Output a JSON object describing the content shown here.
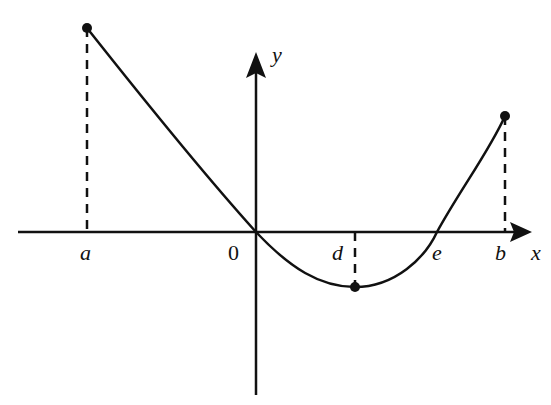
{
  "diagram": {
    "type": "function-graph",
    "axes": {
      "x_label": "x",
      "y_label": "y",
      "origin_label": "0"
    },
    "x_markers": [
      {
        "label": "a",
        "role": "left endpoint"
      },
      {
        "label": "d",
        "role": "local minimum"
      },
      {
        "label": "e",
        "role": "x-intercept"
      },
      {
        "label": "b",
        "role": "right endpoint"
      }
    ],
    "points": [
      {
        "name": "left-endpoint",
        "at": "a",
        "description": "highest point, above x-axis"
      },
      {
        "name": "minimum",
        "at": "d",
        "description": "below x-axis"
      },
      {
        "name": "right-endpoint",
        "at": "b",
        "description": "above x-axis"
      }
    ],
    "curve_description": "Decreasing from (a, f(a)) through origin to minimum at d, increasing through e to (b, f(b))",
    "colors": {
      "ink": "#111111",
      "background": "#ffffff"
    }
  }
}
